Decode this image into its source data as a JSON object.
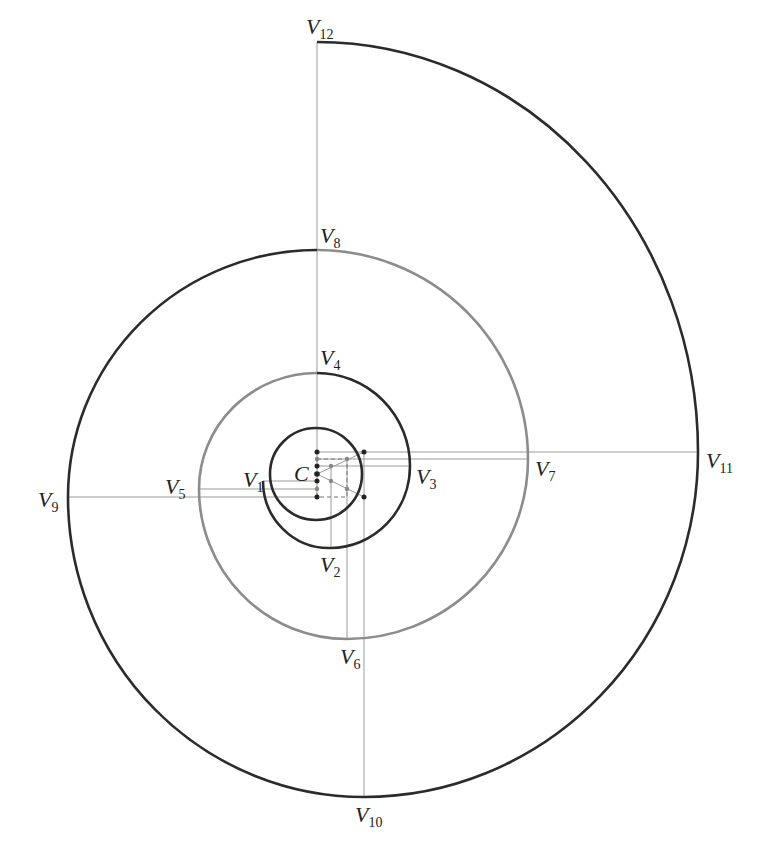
{
  "diagram": {
    "type": "spiral-construction",
    "center_label": "C",
    "labels": [
      {
        "id": "V1",
        "main": "V",
        "sub": "1",
        "x": 243,
        "y": 487
      },
      {
        "id": "V2",
        "main": "V",
        "sub": "2",
        "x": 320,
        "y": 572
      },
      {
        "id": "V3",
        "main": "V",
        "sub": "3",
        "x": 416,
        "y": 484
      },
      {
        "id": "V4",
        "main": "V",
        "sub": "4",
        "x": 320,
        "y": 365
      },
      {
        "id": "V5",
        "main": "V",
        "sub": "5",
        "x": 165,
        "y": 494
      },
      {
        "id": "V6",
        "main": "V",
        "sub": "6",
        "x": 340,
        "y": 664
      },
      {
        "id": "V7",
        "main": "V",
        "sub": "7",
        "x": 535,
        "y": 476
      },
      {
        "id": "V8",
        "main": "V",
        "sub": "8",
        "x": 320,
        "y": 243
      },
      {
        "id": "V9",
        "main": "V",
        "sub": "9",
        "x": 38,
        "y": 507
      },
      {
        "id": "V10",
        "main": "V",
        "sub": "10",
        "x": 355,
        "y": 822
      },
      {
        "id": "V11",
        "main": "V",
        "sub": "11",
        "x": 706,
        "y": 468
      },
      {
        "id": "V12",
        "main": "V",
        "sub": "12",
        "x": 306,
        "y": 34
      }
    ],
    "colors": {
      "dark_arc": "#2b2b2b",
      "grey_arc": "#8c8c8c",
      "guide_line": "#9a9a9a"
    }
  }
}
